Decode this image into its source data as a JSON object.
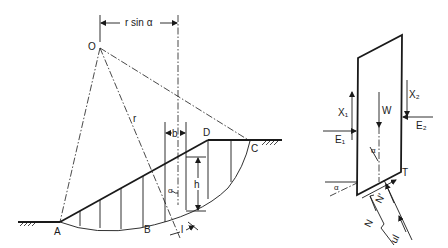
{
  "diagram": {
    "slope_figure": {
      "points": {
        "center": "O",
        "toe": "A",
        "slip_base": "B",
        "crest": "D",
        "slip_exit": "C"
      },
      "labels": {
        "moment_arm": "r sin α",
        "radius": "r",
        "slice_width": "b",
        "slice_height": "h",
        "base_length": "l",
        "base_angle": "α"
      }
    },
    "slice_figure": {
      "labels": {
        "shear_left": "X₁",
        "shear_right": "X₂",
        "weight": "W",
        "normal_left": "E₁",
        "normal_right": "E₂",
        "base_angle_top": "α",
        "base_angle_bottom": "α",
        "shear_base": "T",
        "effective_normal": "N'",
        "total_normal": "N",
        "pore_force": "ul"
      }
    },
    "colors": {
      "ink": "#1a1a1a",
      "background": "#ffffff"
    }
  }
}
